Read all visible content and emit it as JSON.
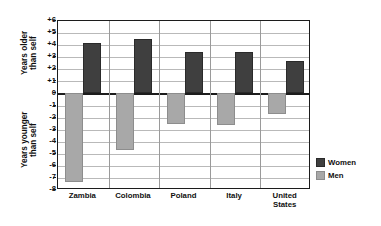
{
  "chart_data": {
    "type": "bar",
    "title": "",
    "subtitle": "",
    "xlabel": "",
    "ylabel_top": "Years older\nthan self",
    "ylabel_bottom": "Years younger\nthan self",
    "categories": [
      "Zambia",
      "Colombia",
      "Poland",
      "Italy",
      "United\nStates"
    ],
    "series": [
      {
        "name": "Women",
        "color": "#3f3f3f",
        "values": [
          4.2,
          4.5,
          3.4,
          3.4,
          2.7
        ]
      },
      {
        "name": "Men",
        "color": "#a8a8a8",
        "values": [
          -7.3,
          -4.7,
          -2.5,
          -2.6,
          -1.7
        ]
      }
    ],
    "ylim": [
      -8,
      6
    ],
    "yticks": [
      6,
      5,
      4,
      3,
      2,
      1,
      0,
      -1,
      -2,
      -3,
      -4,
      -5,
      -6,
      -7,
      -8
    ],
    "ytick_labels": [
      "+6",
      "+5",
      "+4",
      "+3",
      "+2",
      "+1",
      "0",
      "-1",
      "-2",
      "-3",
      "-4",
      "-5",
      "-6",
      "-7",
      "-8"
    ],
    "grid": true,
    "zero_line": true,
    "legend_position": "bottom-right",
    "bar_order": [
      "Men",
      "Women"
    ]
  },
  "legend": {
    "items": [
      {
        "label": "Women",
        "key": "women"
      },
      {
        "label": "Men",
        "key": "men"
      }
    ]
  }
}
